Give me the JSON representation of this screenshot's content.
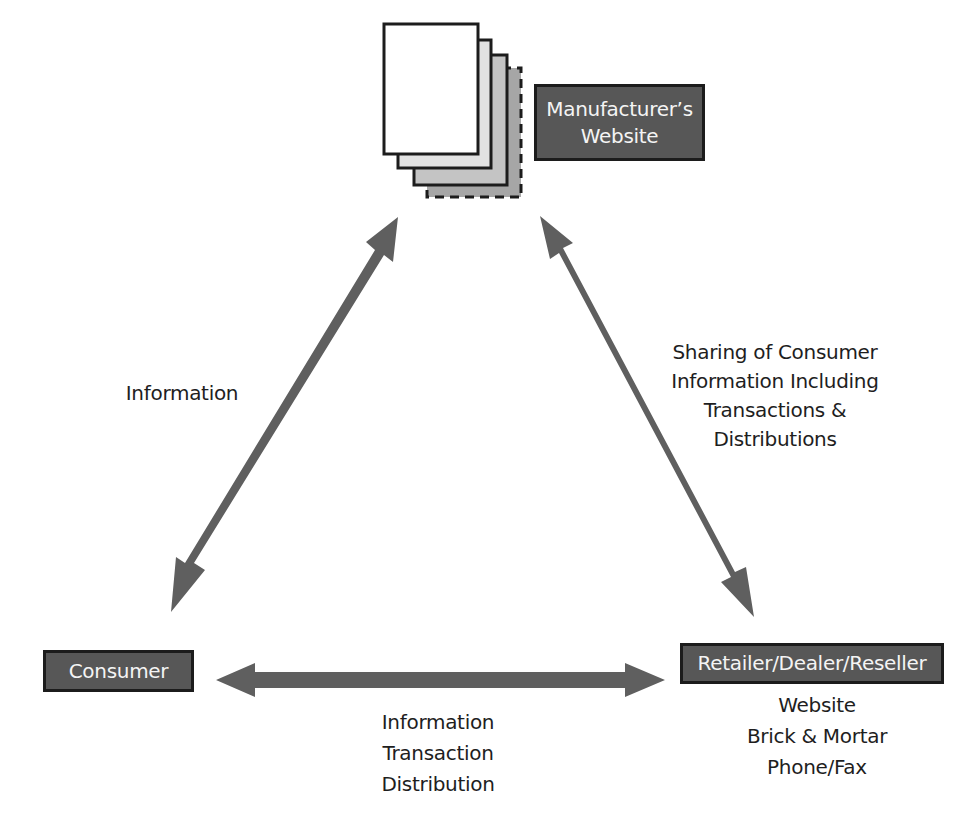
{
  "diagram": {
    "nodes": {
      "manufacturer": {
        "lines": [
          "Manufacturer’s",
          "Website"
        ]
      },
      "consumer": {
        "label": "Consumer"
      },
      "retailer": {
        "label": "Retailer/Dealer/Reseller",
        "channels": [
          "Website",
          "Brick & Mortar",
          "Phone/Fax"
        ]
      }
    },
    "edges": {
      "consumer_manufacturer": {
        "label": "Information"
      },
      "manufacturer_retailer": {
        "lines": [
          "Sharing of Consumer",
          "Information Including",
          "Transactions &",
          "Distributions"
        ]
      },
      "consumer_retailer": {
        "lines": [
          "Information",
          "Transaction",
          "Distribution"
        ]
      }
    },
    "colors": {
      "arrow": "#5f5f5f",
      "box_fill": "#575757",
      "box_border": "#1c1c1c",
      "box_text": "#f4f4f4",
      "page_1": "#ffffff",
      "page_2": "#e2e2e2",
      "page_3": "#c4c4c4",
      "page_4": "#a6a6a6"
    }
  }
}
